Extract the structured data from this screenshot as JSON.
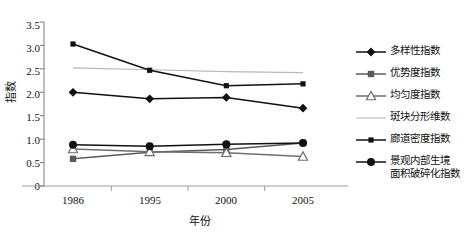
{
  "chart_data": {
    "type": "line",
    "title": "",
    "xlabel": "年份",
    "ylabel": "指数",
    "categories": [
      "1986",
      "1995",
      "2000",
      "2005"
    ],
    "x_tick_labels": [
      "1986",
      "1995",
      "2000",
      "2005"
    ],
    "y_tick_labels": [
      "0",
      "0.5",
      "1.0",
      "1.5",
      "2.0",
      "2.5",
      "3.0",
      "3.5"
    ],
    "y_tick_values": [
      0,
      0.5,
      1.0,
      1.5,
      2.0,
      2.5,
      3.0,
      3.5
    ],
    "ylim": [
      0,
      3.5
    ],
    "grid": false,
    "legend_position": "right",
    "series": [
      {
        "name": "多样性指数",
        "marker": "diamond-filled",
        "color": "#111111",
        "values": [
          2.0,
          1.86,
          1.89,
          1.66
        ]
      },
      {
        "name": "优势度指数",
        "marker": "square-filled-gray",
        "color": "#5a5a5a",
        "values": [
          0.58,
          0.72,
          0.78,
          0.92
        ]
      },
      {
        "name": "均匀度指数",
        "marker": "triangle-open",
        "color": "#6e6e6e",
        "values": [
          0.79,
          0.73,
          0.71,
          0.63
        ]
      },
      {
        "name": "斑块分形维数",
        "marker": "none",
        "color": "#b8b8b8",
        "values": [
          2.52,
          2.48,
          2.44,
          2.42
        ]
      },
      {
        "name": "廊道密度指数",
        "marker": "square-small-dark",
        "color": "#111111",
        "values": [
          3.03,
          2.47,
          2.14,
          2.18
        ]
      },
      {
        "name": "景观内部生境\n面积破碎化指数",
        "marker": "circle-filled",
        "color": "#111111",
        "values": [
          0.88,
          0.85,
          0.89,
          0.92
        ]
      }
    ]
  },
  "legend": {
    "items": [
      {
        "label": "多样性指数",
        "marker": "diamond-filled"
      },
      {
        "label": "优势度指数",
        "marker": "square-filled-gray"
      },
      {
        "label": "均匀度指数",
        "marker": "triangle-open"
      },
      {
        "label": "斑块分形维数",
        "marker": "none"
      },
      {
        "label": "廊道密度指数",
        "marker": "square-small-dark"
      },
      {
        "label": "景观内部生境\n面积破碎化指数",
        "marker": "circle-filled"
      }
    ]
  },
  "axes": {
    "y_title": "指数",
    "x_title": "年份"
  }
}
